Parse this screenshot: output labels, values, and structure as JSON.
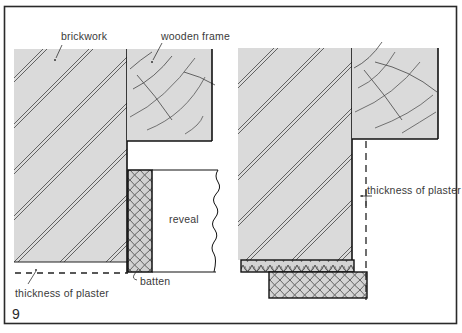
{
  "figure": {
    "number": "9",
    "colors": {
      "fill": "#d9d9d9",
      "stroke": "#1a1a1a",
      "hatch": "#4a4a4a",
      "text": "#3a3a3a",
      "background": "#ffffff"
    }
  },
  "left_detail": {
    "labels": {
      "brickwork": "brickwork",
      "wooden_frame": "wooden frame",
      "reveal": "reveal",
      "batten": "batten",
      "thickness_of_plaster": "thickness of plaster"
    }
  },
  "right_detail": {
    "labels": {
      "thickness_of_plaster": "thickness of plaster"
    }
  }
}
